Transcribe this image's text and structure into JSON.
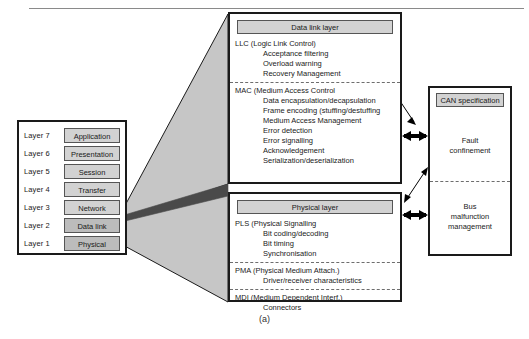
{
  "figure": {
    "caption": "(a)"
  },
  "osi_stack": {
    "name": "OSI layer stack",
    "rows": [
      {
        "number": "Layer 7",
        "name": "Application",
        "highlighted": false
      },
      {
        "number": "Layer 6",
        "name": "Presentation",
        "highlighted": false
      },
      {
        "number": "Layer 5",
        "name": "Session",
        "highlighted": false
      },
      {
        "number": "Layer 4",
        "name": "Transfer",
        "highlighted": false
      },
      {
        "number": "Layer 3",
        "name": "Network",
        "highlighted": false
      },
      {
        "number": "Layer 2",
        "name": "Data link",
        "highlighted": true
      },
      {
        "number": "Layer 1",
        "name": "Physical",
        "highlighted": true
      }
    ]
  },
  "data_link_layer": {
    "title": "Data link layer",
    "sections": [
      {
        "head": "LLC (Logic Link Control)",
        "items": [
          "Acceptance filtering",
          "Overload warning",
          "Recovery Management"
        ]
      },
      {
        "head": "MAC (Medium Access Control",
        "items": [
          "Data encapsulation/decapsulation",
          "Frame encoding (stuffing/destuffing",
          "Medium Access Management",
          "Error detection",
          "Error signalling",
          "Acknowledgement",
          "Serialization/deserialization"
        ]
      }
    ]
  },
  "physical_layer": {
    "title": "Physical layer",
    "sections": [
      {
        "head": "PLS (Physical Signalling",
        "items": [
          "Bit coding/decoding",
          "Bit timing",
          "Synchronisation"
        ]
      },
      {
        "head": "PMA (Physical Medium Attach.)",
        "items": [
          "Driver/receiver characteristics"
        ]
      },
      {
        "head": "MDI (Medium Dependent Interf.)",
        "items": [
          "Connectors"
        ]
      }
    ]
  },
  "can_specification": {
    "title": "CAN specification",
    "sections": [
      "Fault\nconfinement",
      "Bus\nmalfunction\nmanagement"
    ]
  },
  "colors": {
    "title_bar_fill": "#d2d2d2",
    "layer_fill": "#d2d2d2",
    "layer_fill_highlight": "#bcbcbc",
    "fan_light": "#c6c6c6",
    "fan_dark": "#4a4a4a",
    "outline": "#1a1a1a",
    "page_background": "#ffffff"
  }
}
